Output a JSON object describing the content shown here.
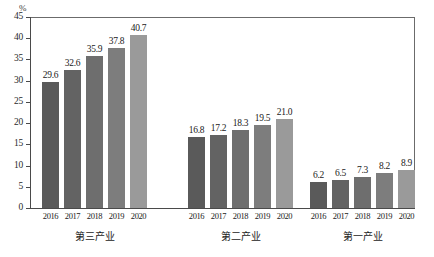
{
  "chart_data": {
    "type": "bar",
    "title": "",
    "subtitle": "",
    "xlabel": "",
    "ylabel": "",
    "unit_label": "%",
    "ylim": [
      0,
      45
    ],
    "ytick_step": 5,
    "ytick_labels": [
      "45",
      "40",
      "35",
      "30",
      "25",
      "20",
      "15",
      "10",
      "5",
      "0"
    ],
    "ytick_values": [
      45,
      40,
      35,
      30,
      25,
      20,
      15,
      10,
      5,
      0
    ],
    "grid": false,
    "legend": "none",
    "categories": [
      "2016",
      "2017",
      "2018",
      "2019",
      "2020"
    ],
    "groups": [
      {
        "name": "第三产业",
        "values": [
          29.6,
          32.6,
          35.9,
          37.8,
          40.7
        ],
        "labels": [
          "29.6",
          "32.6",
          "35.9",
          "37.8",
          "40.7"
        ],
        "xticks": [
          "2016",
          "2017",
          "2018",
          "2019",
          "2020"
        ]
      },
      {
        "name": "第二产业",
        "values": [
          16.8,
          17.2,
          18.3,
          19.5,
          21.0
        ],
        "labels": [
          "16.8",
          "17.2",
          "18.3",
          "19.5",
          "21.0"
        ],
        "xticks": [
          "2016",
          "2017",
          "2018",
          "2019",
          "2020"
        ]
      },
      {
        "name": "第一产业",
        "values": [
          6.2,
          6.5,
          7.3,
          8.2,
          8.9
        ],
        "labels": [
          "6.2",
          "6.5",
          "7.3",
          "8.2",
          "8.9"
        ],
        "xticks": [
          "2016",
          "2017",
          "2018",
          "2019",
          "2020"
        ]
      }
    ],
    "series_colors": [
      "#5a5a5a",
      "#636363",
      "#6e6e6e",
      "#7d7d7d",
      "#9a9a9a"
    ],
    "axis_color": "#4a4a4a",
    "frame_color": "#6b6b6b",
    "background_color": "#ffffff"
  }
}
